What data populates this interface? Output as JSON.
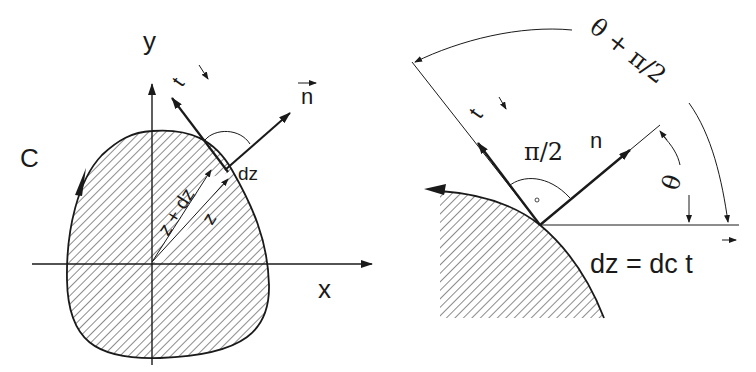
{
  "left_figure": {
    "axis_x_label": "x",
    "axis_y_label": "y",
    "contour_label": "C",
    "tangent_label": "t",
    "normal_label": "n",
    "position_label": "z",
    "position_plus_label": "z + dz",
    "increment_label": "dz"
  },
  "right_figure": {
    "tangent_label": "t",
    "normal_label": "n",
    "right_angle_label": "π/2",
    "theta_label": "θ",
    "theta_plus_label": "θ + π/2",
    "equation_label": "dz = dc t"
  },
  "colors": {
    "ink": "#1a1a1a",
    "background": "#ffffff"
  }
}
